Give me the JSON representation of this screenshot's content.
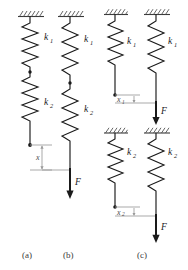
{
  "figure": {
    "panels": [
      {
        "id": "a",
        "caption": "(a)",
        "springs": [
          {
            "label": "k",
            "sub": "1"
          },
          {
            "label": "k",
            "sub": "2"
          }
        ],
        "displacement": {
          "label": "x",
          "sub": ""
        },
        "force": null
      },
      {
        "id": "b",
        "caption": "(b)",
        "springs": [
          {
            "label": "k",
            "sub": "1"
          },
          {
            "label": "k",
            "sub": "2"
          }
        ],
        "displacement": null,
        "force": {
          "label": "F"
        }
      },
      {
        "id": "c",
        "caption": "(c)",
        "springs": [
          {
            "label": "k",
            "sub": "1"
          },
          {
            "label": "k",
            "sub": "1"
          },
          {
            "label": "k",
            "sub": "2"
          },
          {
            "label": "k",
            "sub": "2"
          }
        ],
        "displacements": [
          {
            "label": "x",
            "sub": "1"
          },
          {
            "label": "x",
            "sub": "2"
          }
        ],
        "forces": [
          {
            "label": "F"
          },
          {
            "label": "F"
          }
        ]
      }
    ],
    "colors": {
      "stroke": "#1a1a1a",
      "hatch": "#4a4a4a",
      "dimension": "#9a9a9a",
      "caption": "#3a3a3a",
      "background": "#ffffff"
    }
  }
}
